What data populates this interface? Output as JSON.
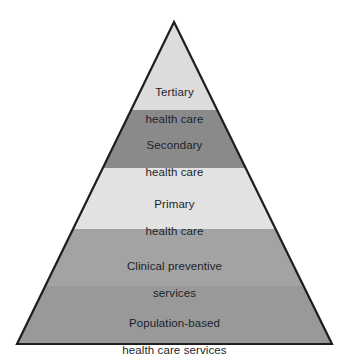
{
  "figure": {
    "name": "health-care-services-pyramid",
    "background_color": "#ffffff",
    "outline_color": "#1e1e1e",
    "text_color": "#1c1f2b"
  },
  "pyramid": {
    "apex": {
      "x": 174,
      "y": 22
    },
    "base_left": {
      "x": 17,
      "y": 344
    },
    "base_right": {
      "x": 332,
      "y": 344
    },
    "bands": [
      {
        "id": "tertiary",
        "line1": "Tertiary",
        "line2": "health care",
        "color": "#dcdcdc",
        "top_y": 22,
        "bottom_y": 110,
        "label_y": 72
      },
      {
        "id": "secondary",
        "line1": "Secondary",
        "line2": "health care",
        "color": "#8a8a8a",
        "top_y": 110,
        "bottom_y": 168,
        "label_y": 125
      },
      {
        "id": "primary",
        "line1": "Primary",
        "line2": "health care",
        "color": "#e2e2e2",
        "top_y": 168,
        "bottom_y": 229,
        "label_y": 184
      },
      {
        "id": "clinical-preventive-services",
        "line1": "Clinical preventive",
        "line2": "services",
        "color": "#a3a3a3",
        "top_y": 229,
        "bottom_y": 286,
        "label_y": 246
      },
      {
        "id": "population-based-health-care-services",
        "line1": "Population-based",
        "line2": "health care services",
        "color": "#999999",
        "top_y": 286,
        "bottom_y": 344,
        "label_y": 303
      }
    ]
  },
  "chart_data": {
    "type": "pyramid",
    "title": "",
    "levels": [
      {
        "rank": 1,
        "position": "top",
        "label": "Tertiary health care"
      },
      {
        "rank": 2,
        "position": "second",
        "label": "Secondary health care"
      },
      {
        "rank": 3,
        "position": "middle",
        "label": "Primary health care"
      },
      {
        "rank": 4,
        "position": "fourth",
        "label": "Clinical preventive services"
      },
      {
        "rank": 5,
        "position": "base",
        "label": "Population-based health care services"
      }
    ]
  }
}
